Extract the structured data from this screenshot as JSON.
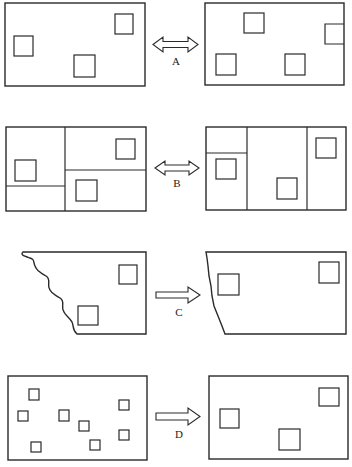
{
  "figure": {
    "rows": [
      {
        "id": "A",
        "label": "A",
        "arrow": "double-headed",
        "left": {
          "shape": "rectangle",
          "partitions": "none",
          "features": 3
        },
        "right": {
          "shape": "rectangle",
          "partitions": "none",
          "features": 4,
          "note": "one feature cut by right edge"
        }
      },
      {
        "id": "B",
        "label": "B",
        "arrow": "double-headed",
        "left": {
          "shape": "rectangle",
          "partitions": "one vertical divider, two horizontal dividers",
          "features": 3
        },
        "right": {
          "shape": "rectangle",
          "partitions": "two vertical dividers, one horizontal divider",
          "features": 3
        }
      },
      {
        "id": "C",
        "label": "C",
        "arrow": "single-headed",
        "left": {
          "shape": "rectangle with wavy left edge",
          "partitions": "none",
          "features": 2
        },
        "right": {
          "shape": "rectangle with irregular left edge",
          "partitions": "none",
          "features": 2
        }
      },
      {
        "id": "D",
        "label": "D",
        "arrow": "single-headed",
        "left": {
          "shape": "rectangle",
          "partitions": "none",
          "features": 8,
          "feature_size": "small"
        },
        "right": {
          "shape": "rectangle",
          "partitions": "none",
          "features": 3,
          "feature_size": "large"
        }
      }
    ]
  },
  "labels": {
    "a": "A",
    "b": "B",
    "c": "C",
    "d": "D"
  },
  "colors": {
    "ink": "#2a2a2a",
    "background": "#ffffff"
  }
}
